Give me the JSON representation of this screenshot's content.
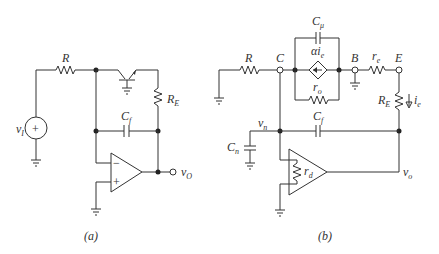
{
  "figure_a": {
    "caption": "(a)",
    "labels": {
      "R": "R",
      "RE_main": "R",
      "RE_sub": "E",
      "Cf_main": "C",
      "Cf_sub": "f",
      "vI_main": "v",
      "vI_sub": "I",
      "vO_main": "v",
      "vO_sub": "O",
      "source_plus": "+",
      "opamp_minus": "−",
      "opamp_plus": "+"
    }
  },
  "figure_b": {
    "caption": "(b)",
    "labels": {
      "R": "R",
      "C": "C",
      "B": "B",
      "E": "E",
      "Cmu_main": "C",
      "Cmu_sub": "μ",
      "alpha_ie_main": "αi",
      "alpha_ie_sub": "e",
      "ro_main": "r",
      "ro_sub": "o",
      "re_main": "r",
      "re_sub": "e",
      "RE_main": "R",
      "RE_sub": "E",
      "ie_main": "i",
      "ie_sub": "e",
      "Cf_main": "C",
      "Cf_sub": "f",
      "vn_main": "v",
      "vn_sub": "n",
      "Cn_main": "C",
      "Cn_sub": "n",
      "rd_main": "r",
      "rd_sub": "d",
      "vo_main": "v",
      "vo_sub": "o"
    }
  }
}
